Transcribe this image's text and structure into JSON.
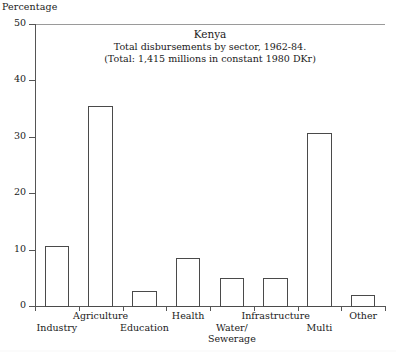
{
  "chart_data": {
    "type": "bar",
    "title": "Kenya",
    "subtitle_1": "Total disbursements by sector, 1962-84.",
    "subtitle_2": "(Total: 1,415 millions in constant 1980 DKr)",
    "ylabel": "Percentage",
    "xlabel": "",
    "ylim": [
      0,
      50
    ],
    "yticks": [
      0,
      10,
      20,
      30,
      40,
      50
    ],
    "ytick_labels": [
      "0",
      "10",
      "20",
      "30",
      "40",
      "50"
    ],
    "grid": false,
    "legend": "none",
    "categories": [
      "Industry",
      "Agriculture",
      "Education",
      "Health",
      "Water/\nSewerage",
      "Infrastructure",
      "Multi",
      "Other"
    ],
    "category_labels": [
      {
        "text": "Industry",
        "row": "bottom"
      },
      {
        "text": "Agriculture",
        "row": "top"
      },
      {
        "text": "Education",
        "row": "bottom"
      },
      {
        "text": "Health",
        "row": "top"
      },
      {
        "text": "Water/",
        "text2": "Sewerage",
        "row": "bottom"
      },
      {
        "text": "Infrastructure",
        "row": "top"
      },
      {
        "text": "Multi",
        "row": "bottom"
      },
      {
        "text": "Other",
        "row": "top"
      }
    ],
    "values": [
      10.7,
      35.5,
      2.7,
      8.5,
      5.0,
      5.0,
      30.7,
      2.0
    ],
    "bar_color": "#ffffff",
    "bar_edge_color": "#4a4a4a",
    "axis_color": "#555555"
  }
}
